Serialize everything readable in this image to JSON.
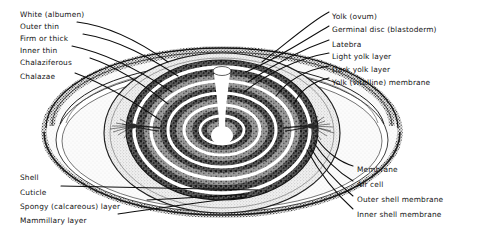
{
  "figure": {
    "type": "anatomical-diagram",
    "background_color": "#ffffff",
    "ink_color": "#141414"
  },
  "labels_left_top": [
    {
      "id": "white-albumen",
      "text": "White (albumen)",
      "x": 20,
      "y": 10,
      "leader": false
    },
    {
      "id": "outer-thin",
      "text": "Outer thin",
      "x": 20,
      "y": 22,
      "leader": true
    },
    {
      "id": "firm-or-thick",
      "text": "Firm or thick",
      "x": 20,
      "y": 34,
      "leader": true
    },
    {
      "id": "inner-thin",
      "text": "Inner thin",
      "x": 20,
      "y": 46,
      "leader": true
    },
    {
      "id": "chalaziferous",
      "text": "Chalaziferous",
      "x": 20,
      "y": 58,
      "leader": true
    },
    {
      "id": "chalazae",
      "text": "Chalazae",
      "x": 20,
      "y": 72,
      "leader": true
    }
  ],
  "labels_left_bottom": [
    {
      "id": "shell",
      "text": "Shell",
      "x": 20,
      "y": 173,
      "leader": false
    },
    {
      "id": "cuticle",
      "text": "Cuticle",
      "x": 20,
      "y": 188,
      "leader": true
    },
    {
      "id": "spongy-calcareous-layer",
      "text": "Spongy (calcareous) layer",
      "x": 20,
      "y": 202,
      "leader": true
    },
    {
      "id": "mammillary-layer",
      "text": "Mammillary layer",
      "x": 20,
      "y": 216,
      "leader": true
    }
  ],
  "labels_right_top": [
    {
      "id": "yolk-ovum",
      "text": "Yolk (ovum)",
      "x": 332,
      "y": 12,
      "leader": true
    },
    {
      "id": "germinal-disc-blastoderm",
      "text": "Germinal disc (blastoderm)",
      "x": 332,
      "y": 25,
      "leader": true
    },
    {
      "id": "latebra",
      "text": "Latebra",
      "x": 332,
      "y": 40,
      "leader": true
    },
    {
      "id": "light-yolk-layer",
      "text": "Light yolk layer",
      "x": 332,
      "y": 52,
      "leader": true
    },
    {
      "id": "dark-yolk-layer",
      "text": "Dark yolk layer",
      "x": 332,
      "y": 65,
      "leader": true
    },
    {
      "id": "yolk-vitelline-membrane",
      "text": "Yolk (vitelline) membrane",
      "x": 332,
      "y": 78,
      "leader": true
    }
  ],
  "labels_right_bottom": [
    {
      "id": "membrane",
      "text": "Membrane",
      "x": 357,
      "y": 165,
      "leader": true
    },
    {
      "id": "air-cell",
      "text": "Air cell",
      "x": 357,
      "y": 180,
      "leader": true
    },
    {
      "id": "outer-shell-membrane",
      "text": "Outer shell membrane",
      "x": 357,
      "y": 195,
      "leader": true
    },
    {
      "id": "inner-shell-membrane",
      "text": "Inner shell membrane",
      "x": 357,
      "y": 210,
      "leader": true
    }
  ],
  "structures": [
    {
      "id": "shell-rim",
      "name": "egg shell rim",
      "shading": "stippled-dark"
    },
    {
      "id": "albumen-body",
      "name": "albumen (egg white)",
      "shading": "light-stipple"
    },
    {
      "id": "vitelline-sac",
      "name": "vitelline membrane sac",
      "shading": "medium-stipple"
    },
    {
      "id": "yolk-rings",
      "name": "concentric yolk layers",
      "shading": "alternating-dark-light",
      "ring_count": 5
    },
    {
      "id": "latebra-flask",
      "name": "latebra with neck",
      "shading": "white"
    },
    {
      "id": "chalaza-left",
      "name": "left chalaza",
      "shading": "fibrous-strands"
    },
    {
      "id": "chalaza-right",
      "name": "right chalaza",
      "shading": "fibrous-strands"
    }
  ]
}
